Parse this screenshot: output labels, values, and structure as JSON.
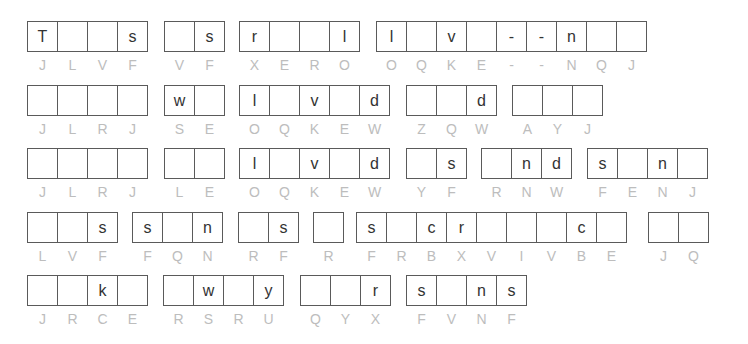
{
  "puzzle": {
    "type": "cryptogram",
    "rows": [
      {
        "top": 21,
        "words": [
          {
            "left": 27,
            "cells": [
              "T",
              "",
              "",
              "s"
            ],
            "hints": [
              "J",
              "L",
              "V",
              "F"
            ]
          },
          {
            "left": 164,
            "cells": [
              "",
              "s"
            ],
            "hints": [
              "V",
              "F"
            ]
          },
          {
            "left": 239,
            "cells": [
              "r",
              "",
              "",
              "l"
            ],
            "hints": [
              "X",
              "E",
              "R",
              "O"
            ]
          },
          {
            "left": 376,
            "cells": [
              "l",
              "",
              "v",
              "",
              "-",
              "-",
              "n",
              "",
              ""
            ],
            "hints": [
              "O",
              "Q",
              "K",
              "E",
              "-",
              "-",
              "N",
              "Q",
              "J"
            ]
          }
        ]
      },
      {
        "top": 85,
        "words": [
          {
            "left": 27,
            "cells": [
              "",
              "",
              "",
              ""
            ],
            "hints": [
              "J",
              "L",
              "R",
              "J"
            ]
          },
          {
            "left": 164,
            "cells": [
              "w",
              ""
            ],
            "hints": [
              "S",
              "E"
            ]
          },
          {
            "left": 239,
            "cells": [
              "l",
              "",
              "v",
              "",
              "d"
            ],
            "hints": [
              "O",
              "Q",
              "K",
              "E",
              "W"
            ]
          },
          {
            "left": 406,
            "cells": [
              "",
              "",
              "d"
            ],
            "hints": [
              "Z",
              "Q",
              "W"
            ]
          },
          {
            "left": 512,
            "cells": [
              "",
              "",
              ""
            ],
            "hints": [
              "A",
              "Y",
              "J"
            ]
          }
        ]
      },
      {
        "top": 148,
        "words": [
          {
            "left": 27,
            "cells": [
              "",
              "",
              "",
              ""
            ],
            "hints": [
              "J",
              "L",
              "R",
              "J"
            ]
          },
          {
            "left": 164,
            "cells": [
              "",
              ""
            ],
            "hints": [
              "L",
              "E"
            ]
          },
          {
            "left": 239,
            "cells": [
              "l",
              "",
              "v",
              "",
              "d"
            ],
            "hints": [
              "O",
              "Q",
              "K",
              "E",
              "W"
            ]
          },
          {
            "left": 406,
            "cells": [
              "",
              "s"
            ],
            "hints": [
              "Y",
              "F"
            ]
          },
          {
            "left": 481,
            "cells": [
              "",
              "n",
              "d"
            ],
            "hints": [
              "R",
              "N",
              "W"
            ]
          },
          {
            "left": 587,
            "cells": [
              "s",
              "",
              "n",
              ""
            ],
            "hints": [
              "F",
              "E",
              "N",
              "J"
            ]
          }
        ]
      },
      {
        "top": 212,
        "words": [
          {
            "left": 27,
            "cells": [
              "",
              "",
              "s"
            ],
            "hints": [
              "L",
              "V",
              "F"
            ]
          },
          {
            "left": 132,
            "cells": [
              "s",
              "",
              "n"
            ],
            "hints": [
              "F",
              "Q",
              "N"
            ]
          },
          {
            "left": 238,
            "cells": [
              "",
              "s"
            ],
            "hints": [
              "R",
              "F"
            ]
          },
          {
            "left": 313,
            "cells": [
              ""
            ],
            "hints": [
              "R"
            ]
          },
          {
            "left": 356,
            "cells": [
              "s",
              "",
              "c",
              "r",
              "",
              "",
              "",
              "c",
              ""
            ],
            "hints": [
              "F",
              "R",
              "B",
              "X",
              "V",
              "I",
              "V",
              "B",
              "E"
            ]
          },
          {
            "left": 648,
            "cells": [
              "",
              ""
            ],
            "hints": [
              "J",
              "Q"
            ]
          }
        ]
      },
      {
        "top": 275,
        "words": [
          {
            "left": 27,
            "cells": [
              "",
              "",
              "k",
              ""
            ],
            "hints": [
              "J",
              "R",
              "C",
              "E"
            ]
          },
          {
            "left": 163,
            "cells": [
              "",
              "w",
              "",
              "y"
            ],
            "hints": [
              "R",
              "S",
              "R",
              "U"
            ]
          },
          {
            "left": 300,
            "cells": [
              "",
              "",
              "r"
            ],
            "hints": [
              "Q",
              "Y",
              "X"
            ]
          },
          {
            "left": 406,
            "cells": [
              "s",
              "",
              "n",
              "s"
            ],
            "hints": [
              "F",
              "V",
              "N",
              "F"
            ]
          }
        ]
      }
    ]
  },
  "colors": {
    "border": "#5a5a5a",
    "letter": "#333333",
    "hint": "#bdbdbd",
    "background": "#ffffff"
  }
}
